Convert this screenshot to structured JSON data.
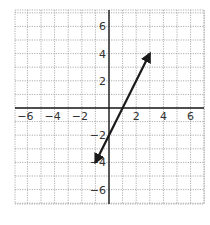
{
  "chart_data": {
    "type": "line",
    "title": "",
    "xlabel": "",
    "ylabel": "",
    "xlim": [
      -7,
      7
    ],
    "ylim": [
      -7,
      7
    ],
    "grid": true,
    "grid_style": "dotted",
    "x_ticks": [
      -6,
      -4,
      -2,
      2,
      4,
      6
    ],
    "y_ticks": [
      -6,
      -4,
      -2,
      2,
      4,
      6
    ],
    "x_tick_labels": [
      "−6",
      "−4",
      "−2",
      "2",
      "4",
      "6"
    ],
    "y_tick_labels": [
      "−6",
      "−4",
      "−2",
      "2",
      "4",
      "6"
    ],
    "series": [
      {
        "name": "line",
        "equation": "y = 2x - 2",
        "points": [
          [
            -1,
            -4
          ],
          [
            3,
            4
          ]
        ],
        "arrows": "both",
        "color": "#1a1a1a"
      }
    ]
  },
  "colors": {
    "grid": "#9a9a9a",
    "axis": "#1a1a1a",
    "line": "#1a1a1a"
  }
}
